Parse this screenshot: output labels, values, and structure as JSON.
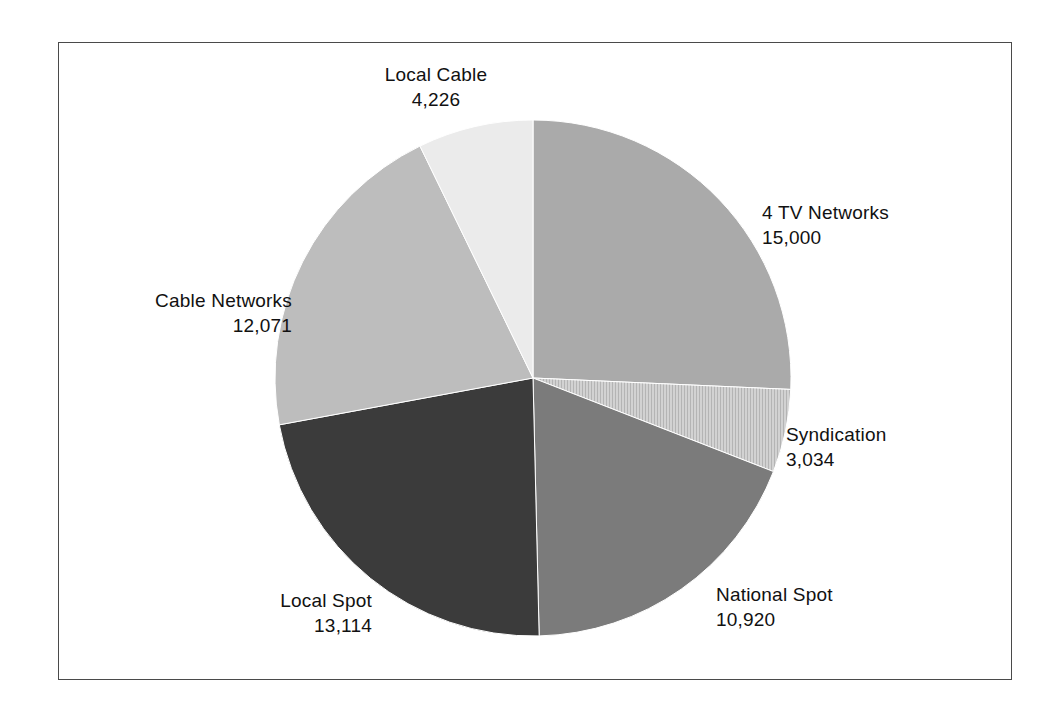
{
  "figure": {
    "border_color": "#4a4a4a",
    "background": "#ffffff"
  },
  "chart_data": {
    "type": "pie",
    "title": "",
    "subtitle": "",
    "xlabel": "",
    "ylabel": "",
    "legend_position": "none",
    "grid": false,
    "total": 58365,
    "start_angle_deg": 0,
    "direction": "clockwise",
    "center": {
      "x": 533,
      "y": 378
    },
    "radius": 258,
    "categories": [
      "4 TV Networks",
      "Syndication",
      "National Spot",
      "Local Spot",
      "Cable Networks",
      "Local Cable"
    ],
    "values": [
      15000,
      3034,
      10920,
      13114,
      12071,
      4226
    ],
    "value_labels": [
      "15,000",
      "3,034",
      "10,920",
      "13,114",
      "12,071",
      "4,226"
    ],
    "colors": [
      "#aaaaaa",
      "#c8c8c8",
      "#7b7b7b",
      "#3b3b3b",
      "#bdbdbd",
      "#ebebeb"
    ],
    "slices": [
      {
        "name": "4 TV Networks",
        "value": 15000,
        "value_label": "15,000",
        "color": "#aaaaaa",
        "start_deg": 0.0,
        "sweep_deg": 92.54
      },
      {
        "name": "Syndication",
        "value": 3034,
        "value_label": "3,034",
        "color": "#c8c8c8",
        "start_deg": 92.54,
        "sweep_deg": 18.72
      },
      {
        "name": "National Spot",
        "value": 10920,
        "value_label": "10,920",
        "color": "#7b7b7b",
        "start_deg": 111.26,
        "sweep_deg": 67.37
      },
      {
        "name": "Local Spot",
        "value": 13114,
        "value_label": "13,114",
        "color": "#3b3b3b",
        "start_deg": 178.63,
        "sweep_deg": 80.91
      },
      {
        "name": "Cable Networks",
        "value": 12071,
        "value_label": "12,071",
        "color": "#bdbdbd",
        "start_deg": 259.54,
        "sweep_deg": 74.47
      },
      {
        "name": "Local Cable",
        "value": 4226,
        "value_label": "4,226",
        "color": "#ebebeb",
        "start_deg": 334.01,
        "sweep_deg": 25.99
      }
    ]
  },
  "labels": {
    "local_cable": {
      "name": "Local Cable",
      "value": "4,226"
    },
    "tv_networks": {
      "name": "4 TV Networks",
      "value": "15,000"
    },
    "syndication": {
      "name": "Syndication",
      "value": "3,034"
    },
    "national_spot": {
      "name": "National Spot",
      "value": "10,920"
    },
    "local_spot": {
      "name": "Local Spot",
      "value": "13,114"
    },
    "cable_networks": {
      "name": "Cable Networks",
      "value": "12,071"
    }
  }
}
